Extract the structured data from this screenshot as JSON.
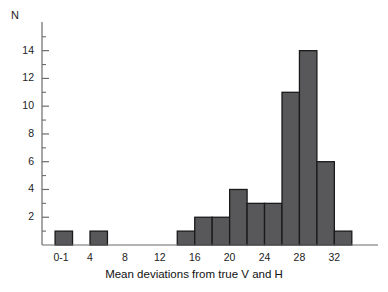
{
  "axes": {
    "ylabel": "N",
    "xlabel": "Mean deviations from true V and H",
    "yticks": [
      2,
      4,
      6,
      8,
      10,
      12,
      14
    ],
    "yticks_minor": [
      1,
      3,
      5,
      7,
      9,
      11,
      13,
      15
    ],
    "xtick_labels": [
      "0-1",
      "4",
      "8",
      "12",
      "16",
      "20",
      "24",
      "28",
      "32"
    ],
    "xtick_values": [
      0,
      4,
      8,
      12,
      16,
      20,
      24,
      28,
      32
    ]
  },
  "style": {
    "bar_fill": "#58585a",
    "bar_stroke": "#1a1a1a",
    "axis_color": "#6b6b6b",
    "text_color": "#1c1c1c"
  },
  "chart_data": {
    "type": "bar",
    "title": "",
    "subtitle": "",
    "xlabel": "Mean deviations from true V and H",
    "ylabel": "N",
    "xlim": [
      -1.5,
      37
    ],
    "ylim": [
      0,
      15.2
    ],
    "grid": false,
    "legend": null,
    "bin_width": 2,
    "categories": [
      "0-2",
      "2-4",
      "4-6",
      "6-8",
      "8-10",
      "10-12",
      "12-14",
      "14-16",
      "16-18",
      "18-20",
      "20-22",
      "22-24",
      "24-26",
      "26-28",
      "28-30",
      "30-32",
      "32-34"
    ],
    "bin_starts": [
      0,
      2,
      4,
      6,
      8,
      10,
      12,
      14,
      16,
      18,
      20,
      22,
      24,
      26,
      28,
      30,
      32
    ],
    "values": [
      1,
      0,
      1,
      0,
      0,
      0,
      0,
      1,
      2,
      2,
      4,
      3,
      3,
      11,
      14,
      6,
      1
    ]
  }
}
